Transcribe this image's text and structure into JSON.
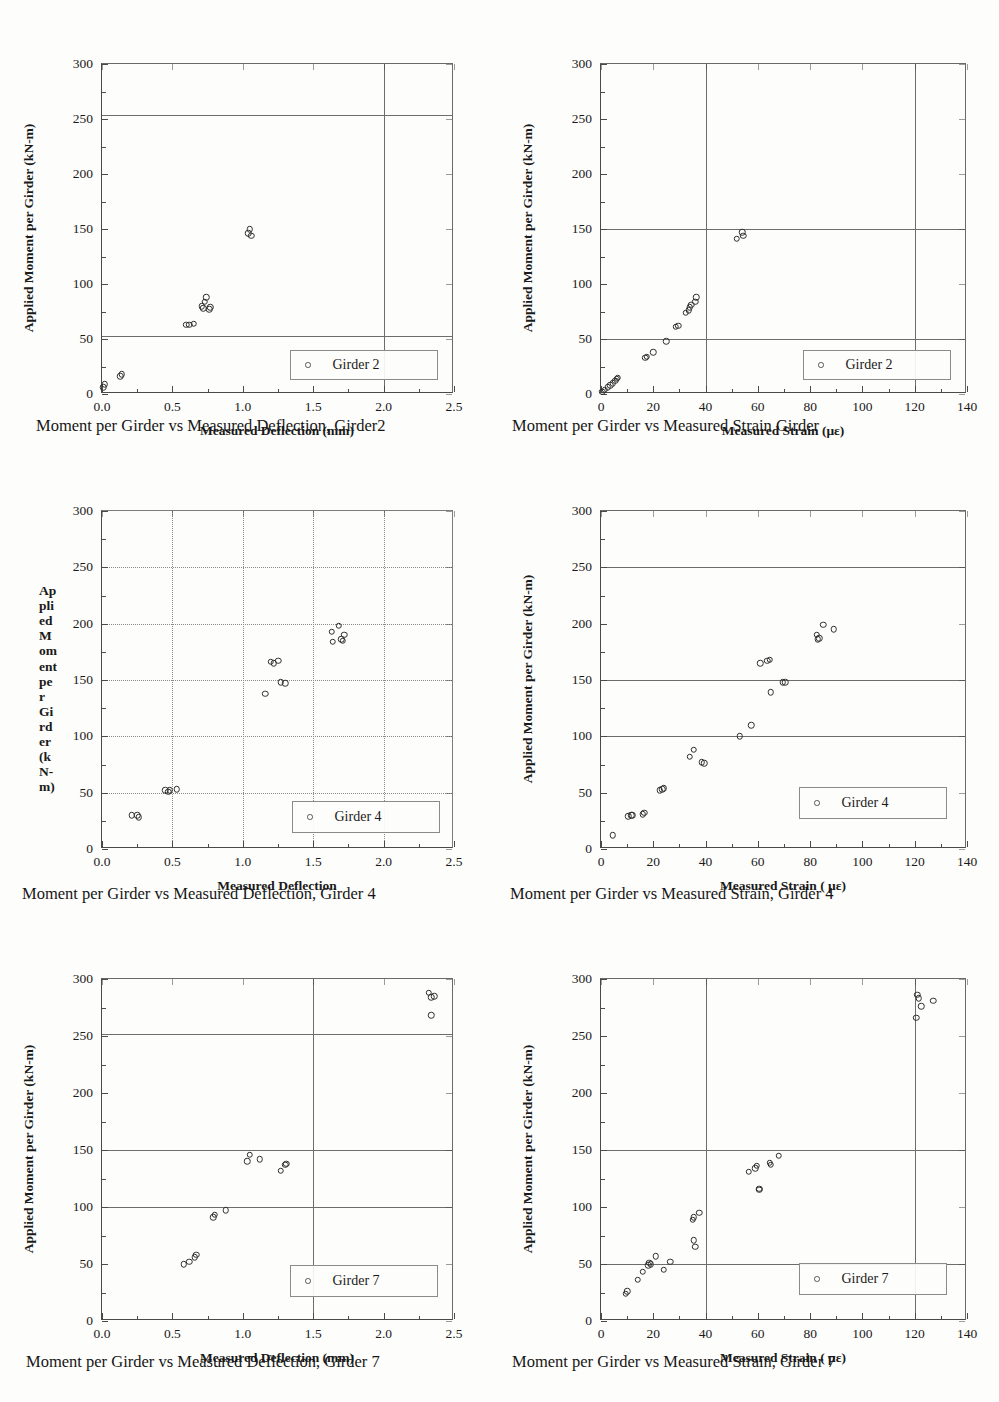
{
  "page": {
    "number": ""
  },
  "common": {
    "y_title": "Applied Moment per Girder (kN-m)",
    "y_ticks": [
      "0",
      "50",
      "100",
      "150",
      "200",
      "250",
      "300"
    ],
    "deflection_x_ticks": [
      "0.0",
      "0.5",
      "1.0",
      "1.5",
      "2.0",
      "2.5"
    ],
    "strain_x_ticks": [
      "0",
      "20",
      "40",
      "60",
      "80",
      "100",
      "120",
      "140"
    ],
    "marker_icon": "open-circle-marker"
  },
  "figures": [
    {
      "id": "fig-g2-deflection",
      "caption": "Moment per Girder vs Measured Deflection, Girder2",
      "legend_label": "Girder 2",
      "y_title": "Applied Moment per Girder (kN-m)",
      "y_title_broken": null,
      "x_title": "Measured Deflection (mm)",
      "gridstyle": "solid",
      "chart_data": {
        "type": "scatter",
        "title": "Moment per Girder vs Measured Deflection, Girder2",
        "xlabel": "Measured Deflection (mm)",
        "ylabel": "Applied Moment per Girder (kN-m)",
        "xlim": [
          0.0,
          2.5
        ],
        "ylim": [
          0,
          300
        ],
        "xticks": [
          0.0,
          0.5,
          1.0,
          1.5,
          2.0,
          2.5
        ],
        "yticks": [
          0,
          50,
          100,
          150,
          200,
          250,
          300
        ],
        "grid": true,
        "gridlines_h": [
          53,
          254
        ],
        "gridlines_v": [
          2.0
        ],
        "legend_position": "bottom-right",
        "series": [
          {
            "name": "Girder 2",
            "marker": "open circle",
            "points": [
              [
                0.01,
                6
              ],
              [
                0.02,
                9
              ],
              [
                0.13,
                16
              ],
              [
                0.14,
                18
              ],
              [
                0.6,
                63
              ],
              [
                0.62,
                63
              ],
              [
                0.65,
                64
              ],
              [
                0.71,
                80
              ],
              [
                0.72,
                78
              ],
              [
                0.73,
                84
              ],
              [
                0.74,
                88
              ],
              [
                0.76,
                77
              ],
              [
                0.77,
                79
              ],
              [
                1.04,
                146
              ],
              [
                1.05,
                150
              ],
              [
                1.06,
                144
              ]
            ]
          }
        ]
      }
    },
    {
      "id": "fig-g2-strain",
      "caption": "Moment per Girder vs Measured Strain Girder",
      "legend_label": "Girder 2",
      "y_title": "Applied Moment per Girder (kN-m)",
      "y_title_broken": null,
      "x_title": "Measured Strain   (με)",
      "gridstyle": "solid",
      "chart_data": {
        "type": "scatter",
        "title": "Moment per Girder vs Measured Strain Girder",
        "xlabel": "Measured Strain   (με)",
        "ylabel": "Applied Moment per Girder (kN-m)",
        "xlim": [
          0,
          140
        ],
        "ylim": [
          0,
          300
        ],
        "xticks": [
          0,
          20,
          40,
          60,
          80,
          100,
          120,
          140
        ],
        "yticks": [
          0,
          50,
          100,
          150,
          200,
          250,
          300
        ],
        "grid": true,
        "gridlines_h": [
          50,
          150
        ],
        "gridlines_v": [
          40,
          120
        ],
        "legend_position": "bottom-right",
        "series": [
          {
            "name": "Girder 2",
            "marker": "open circle",
            "points": [
              [
                0.5,
                2
              ],
              [
                1.5,
                4
              ],
              [
                2.5,
                6
              ],
              [
                3.5,
                8
              ],
              [
                4.5,
                10
              ],
              [
                5.5,
                12
              ],
              [
                6.0,
                14
              ],
              [
                6.5,
                15
              ],
              [
                17,
                33
              ],
              [
                17.5,
                34
              ],
              [
                20,
                38
              ],
              [
                25,
                48
              ],
              [
                28.5,
                61
              ],
              [
                29.5,
                62
              ],
              [
                32.5,
                74
              ],
              [
                33.5,
                76
              ],
              [
                34,
                79
              ],
              [
                34.5,
                81
              ],
              [
                36,
                84
              ],
              [
                36.5,
                88
              ],
              [
                52,
                141
              ],
              [
                54,
                147
              ],
              [
                54.5,
                144
              ]
            ]
          }
        ]
      }
    },
    {
      "id": "fig-g4-deflection",
      "caption": "Moment per Girder vs Measured Deflection, Girder 4",
      "legend_label": "Girder 4",
      "y_title": null,
      "y_title_broken": [
        "Ap",
        "pli",
        "ed",
        "M",
        "om",
        "ent",
        "pe",
        "r",
        "Gi",
        "rd",
        "er",
        "(k",
        "N-",
        "m)"
      ],
      "x_title": "Measured Deflection",
      "gridstyle": "dotted",
      "chart_data": {
        "type": "scatter",
        "title": "Moment per Girder vs Measured Deflection, Girder 4",
        "xlabel": "Measured Deflection",
        "ylabel": "Applied Moment per Girder (kN-m)",
        "xlim": [
          0.0,
          2.5
        ],
        "ylim": [
          0,
          300
        ],
        "xticks": [
          0.0,
          0.5,
          1.0,
          1.5,
          2.0,
          2.5
        ],
        "yticks": [
          0,
          50,
          100,
          150,
          200,
          250,
          300
        ],
        "grid": true,
        "gridlines_h": [
          50,
          100,
          150,
          200,
          250
        ],
        "gridlines_v": [
          0.5,
          1.0,
          1.5,
          2.0
        ],
        "legend_position": "bottom-right",
        "series": [
          {
            "name": "Girder 4",
            "marker": "open circle",
            "points": [
              [
                0.21,
                30
              ],
              [
                0.25,
                30
              ],
              [
                0.26,
                28
              ],
              [
                0.45,
                52
              ],
              [
                0.47,
                51
              ],
              [
                0.48,
                52
              ],
              [
                0.53,
                53
              ],
              [
                1.16,
                138
              ],
              [
                1.2,
                166
              ],
              [
                1.22,
                165
              ],
              [
                1.25,
                167
              ],
              [
                1.27,
                148
              ],
              [
                1.3,
                147
              ],
              [
                1.63,
                193
              ],
              [
                1.64,
                184
              ],
              [
                1.68,
                198
              ],
              [
                1.7,
                186
              ],
              [
                1.71,
                185
              ],
              [
                1.72,
                190
              ]
            ]
          }
        ]
      }
    },
    {
      "id": "fig-g4-strain",
      "caption": "Moment per Girder vs Measured Strain, Girder 4",
      "legend_label": "Girder 4",
      "y_title": "Applied Moment per Girder (kN-m)",
      "y_title_broken": null,
      "x_title": "Measured Strain (  με)",
      "gridstyle": "solid",
      "chart_data": {
        "type": "scatter",
        "title": "Moment per Girder vs Measured Strain, Girder 4",
        "xlabel": "Measured Strain (  με)",
        "ylabel": "Applied Moment per Girder (kN-m)",
        "xlim": [
          0,
          140
        ],
        "ylim": [
          0,
          300
        ],
        "xticks": [
          0,
          20,
          40,
          60,
          80,
          100,
          120,
          140
        ],
        "yticks": [
          0,
          50,
          100,
          150,
          200,
          250,
          300
        ],
        "grid": true,
        "gridlines_h": [
          100,
          150,
          250
        ],
        "gridlines_v": [],
        "legend_position": "bottom-right",
        "series": [
          {
            "name": "Girder 4",
            "marker": "open circle",
            "points": [
              [
                4.5,
                12
              ],
              [
                10.5,
                29
              ],
              [
                11.5,
                30
              ],
              [
                12,
                30
              ],
              [
                16,
                31
              ],
              [
                16.5,
                32
              ],
              [
                22.5,
                52
              ],
              [
                23.5,
                53
              ],
              [
                24,
                54
              ],
              [
                34,
                82
              ],
              [
                35.5,
                88
              ],
              [
                38.5,
                77
              ],
              [
                39.5,
                76
              ],
              [
                53,
                100
              ],
              [
                57.5,
                110
              ],
              [
                61,
                165
              ],
              [
                63.5,
                167
              ],
              [
                64.5,
                168
              ],
              [
                65,
                139
              ],
              [
                69.5,
                148
              ],
              [
                70.5,
                148
              ],
              [
                82.5,
                190
              ],
              [
                83,
                186
              ],
              [
                83.5,
                187
              ],
              [
                85,
                199
              ],
              [
                89,
                195
              ]
            ]
          }
        ]
      }
    },
    {
      "id": "fig-g7-deflection",
      "caption": "Moment per Girder vs Measured Deflection, Girder 7",
      "legend_label": "Girder 7",
      "y_title": "Applied Moment per Girder (kN-m)",
      "y_title_broken": null,
      "x_title": "Measured Deflection (mm)",
      "gridstyle": "solid",
      "chart_data": {
        "type": "scatter",
        "title": "Moment per Girder vs Measured Deflection, Girder 7",
        "xlabel": "Measured Deflection (mm)",
        "ylabel": "Applied Moment per Girder (kN-m)",
        "xlim": [
          0.0,
          2.5
        ],
        "ylim": [
          0,
          300
        ],
        "xticks": [
          0.0,
          0.5,
          1.0,
          1.5,
          2.0,
          2.5
        ],
        "yticks": [
          0,
          50,
          100,
          150,
          200,
          250,
          300
        ],
        "grid": true,
        "gridlines_h": [
          100,
          150,
          252
        ],
        "gridlines_v": [
          1.5
        ],
        "legend_position": "bottom-right",
        "series": [
          {
            "name": "Girder 7",
            "marker": "open circle",
            "points": [
              [
                0.58,
                50
              ],
              [
                0.62,
                52
              ],
              [
                0.66,
                56
              ],
              [
                0.67,
                58
              ],
              [
                0.79,
                91
              ],
              [
                0.8,
                93
              ],
              [
                0.88,
                97
              ],
              [
                1.03,
                140
              ],
              [
                1.05,
                146
              ],
              [
                1.12,
                142
              ],
              [
                1.27,
                132
              ],
              [
                1.3,
                137
              ],
              [
                1.31,
                138
              ],
              [
                2.32,
                288
              ],
              [
                2.34,
                284
              ],
              [
                2.34,
                268
              ],
              [
                2.36,
                285
              ]
            ]
          }
        ]
      }
    },
    {
      "id": "fig-g7-strain",
      "caption": "Moment per Girder vs Measured Strain, Girder 7",
      "legend_label": "Girder 7",
      "y_title": "Applied Moment per Girder (kN-m)",
      "y_title_broken": null,
      "x_title": "Measured Strain (  με)",
      "gridstyle": "solid",
      "chart_data": {
        "type": "scatter",
        "title": "Moment per Girder vs Measured Strain, Girder 7",
        "xlabel": "Measured Strain (  με)",
        "ylabel": "Applied Moment per Girder (kN-m)",
        "xlim": [
          0,
          140
        ],
        "ylim": [
          0,
          300
        ],
        "xticks": [
          0,
          20,
          40,
          60,
          80,
          100,
          120,
          140
        ],
        "yticks": [
          0,
          50,
          100,
          150,
          200,
          250,
          300
        ],
        "grid": true,
        "gridlines_h": [
          50,
          150
        ],
        "gridlines_v": [
          40,
          120
        ],
        "legend_position": "bottom-right",
        "series": [
          {
            "name": "Girder 7",
            "marker": "open circle",
            "points": [
              [
                9.5,
                24
              ],
              [
                10,
                26
              ],
              [
                14,
                36
              ],
              [
                16,
                43
              ],
              [
                18,
                49
              ],
              [
                18.5,
                51
              ],
              [
                19,
                50
              ],
              [
                21,
                57
              ],
              [
                24,
                45
              ],
              [
                26.5,
                52
              ],
              [
                35,
                89
              ],
              [
                35.5,
                91
              ],
              [
                37.5,
                95
              ],
              [
                35.5,
                71
              ],
              [
                36,
                65
              ],
              [
                56.5,
                131
              ],
              [
                59,
                134
              ],
              [
                59.5,
                136
              ],
              [
                60.5,
                116
              ],
              [
                60.5,
                115
              ],
              [
                64.5,
                139
              ],
              [
                65,
                137
              ],
              [
                68,
                145
              ],
              [
                121,
                286
              ],
              [
                121.5,
                283
              ],
              [
                120.5,
                266
              ],
              [
                122.5,
                276
              ],
              [
                127,
                281
              ]
            ]
          }
        ]
      }
    }
  ],
  "ghost_text": [
    "faint-scan-artifact"
  ]
}
